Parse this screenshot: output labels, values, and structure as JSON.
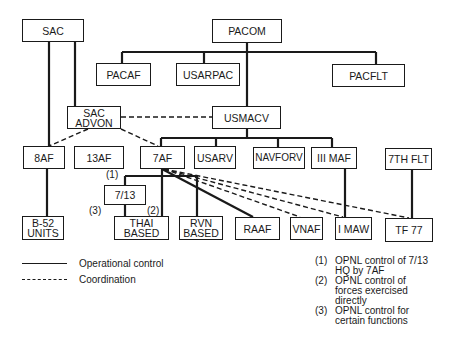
{
  "diagram": {
    "type": "organization-chart",
    "nodes": [
      {
        "id": "sac",
        "label": "SAC",
        "x": 22,
        "y": 19,
        "w": 62,
        "h": 23
      },
      {
        "id": "pacom",
        "label": "PACOM",
        "x": 212,
        "y": 19,
        "w": 70,
        "h": 24
      },
      {
        "id": "pacaf",
        "label": "PACAF",
        "x": 96,
        "y": 63,
        "w": 55,
        "h": 23
      },
      {
        "id": "usarpac",
        "label": "USARPAC",
        "x": 176,
        "y": 63,
        "w": 64,
        "h": 23
      },
      {
        "id": "pacflt",
        "label": "PACFLT",
        "x": 332,
        "y": 64,
        "w": 73,
        "h": 23
      },
      {
        "id": "sac_advon",
        "label": "SAC\nADVON",
        "x": 67,
        "y": 106,
        "w": 54,
        "h": 23
      },
      {
        "id": "usmacv",
        "label": "USMACV",
        "x": 212,
        "y": 106,
        "w": 69,
        "h": 23
      },
      {
        "id": "8af",
        "label": "8AF",
        "x": 23,
        "y": 146,
        "w": 42,
        "h": 23
      },
      {
        "id": "13af",
        "label": "13AF",
        "x": 74,
        "y": 146,
        "w": 50,
        "h": 23
      },
      {
        "id": "7af",
        "label": "7AF",
        "x": 140,
        "y": 146,
        "w": 45,
        "h": 23
      },
      {
        "id": "usarv",
        "label": "USARV",
        "x": 194,
        "y": 146,
        "w": 42,
        "h": 23
      },
      {
        "id": "navforv",
        "label": "NAVFORV",
        "x": 253,
        "y": 147,
        "w": 52,
        "h": 22
      },
      {
        "id": "iii_maf",
        "label": "III MAF",
        "x": 311,
        "y": 147,
        "w": 46,
        "h": 22
      },
      {
        "id": "7th_flt",
        "label": "7TH FLT",
        "x": 385,
        "y": 148,
        "w": 47,
        "h": 22
      },
      {
        "id": "7_13",
        "label": "7/13",
        "x": 104,
        "y": 185,
        "w": 42,
        "h": 20
      },
      {
        "id": "b52_units",
        "label": "B-52\nUNITS",
        "x": 22,
        "y": 216,
        "w": 42,
        "h": 24
      },
      {
        "id": "thai_based",
        "label": "THAI\nBASED",
        "x": 114,
        "y": 216,
        "w": 55,
        "h": 24
      },
      {
        "id": "rvn_based",
        "label": "RVN\nBASED",
        "x": 179,
        "y": 216,
        "w": 44,
        "h": 24
      },
      {
        "id": "raaf",
        "label": "RAAF",
        "x": 235,
        "y": 217,
        "w": 45,
        "h": 23
      },
      {
        "id": "vnaf",
        "label": "VNAF",
        "x": 290,
        "y": 217,
        "w": 33,
        "h": 23
      },
      {
        "id": "i_maw",
        "label": "I MAW",
        "x": 335,
        "y": 217,
        "w": 37,
        "h": 23
      },
      {
        "id": "tf77",
        "label": "TF 77",
        "x": 385,
        "y": 218,
        "w": 48,
        "h": 24
      }
    ],
    "edges": [
      {
        "from": "sac",
        "to": "8af",
        "type": "operational"
      },
      {
        "from": "sac",
        "to": "sac_advon",
        "type": "operational"
      },
      {
        "from": "pacom",
        "to": "pacaf",
        "type": "operational"
      },
      {
        "from": "pacom",
        "to": "usarpac",
        "type": "operational"
      },
      {
        "from": "pacom",
        "to": "pacflt",
        "type": "operational"
      },
      {
        "from": "pacom",
        "to": "usmacv",
        "type": "operational"
      },
      {
        "from": "usmacv",
        "to": "7af",
        "type": "operational"
      },
      {
        "from": "usmacv",
        "to": "usarv",
        "type": "operational"
      },
      {
        "from": "usmacv",
        "to": "navforv",
        "type": "operational"
      },
      {
        "from": "usmacv",
        "to": "iii_maf",
        "type": "operational"
      },
      {
        "from": "8af",
        "to": "b52_units",
        "type": "operational"
      },
      {
        "from": "7af",
        "to": "7_13",
        "type": "operational",
        "note": "(1)"
      },
      {
        "from": "7af",
        "to": "thai_based",
        "type": "operational",
        "note": "(2)"
      },
      {
        "from": "7_13",
        "to": "thai_based",
        "type": "operational",
        "note": "(3)"
      },
      {
        "from": "7af",
        "to": "rvn_based",
        "type": "operational"
      },
      {
        "from": "7af",
        "to": "raaf",
        "type": "operational"
      },
      {
        "from": "iii_maf",
        "to": "i_maw",
        "type": "operational"
      },
      {
        "from": "7th_flt",
        "to": "tf77",
        "type": "operational"
      },
      {
        "from": "sac_advon",
        "to": "usmacv",
        "type": "coordination"
      },
      {
        "from": "sac_advon",
        "to": "8af",
        "type": "coordination"
      },
      {
        "from": "sac_advon",
        "to": "7af",
        "type": "coordination"
      },
      {
        "from": "7af",
        "to": "vnaf",
        "type": "coordination"
      },
      {
        "from": "7af",
        "to": "i_maw",
        "type": "coordination"
      },
      {
        "from": "7af",
        "to": "tf77",
        "type": "coordination"
      }
    ],
    "edge_notes": [
      {
        "label": "(1)",
        "x": 106,
        "y": 172
      },
      {
        "label": "(2)",
        "x": 147,
        "y": 207
      },
      {
        "label": "(3)",
        "x": 89,
        "y": 207
      }
    ]
  },
  "legend": {
    "items": [
      {
        "style": "solid",
        "label": "Operational control"
      },
      {
        "style": "dashed",
        "label": "Coordination"
      }
    ]
  },
  "footnotes": [
    {
      "num": "(1)",
      "text": "OPNL control of 7/13\nHQ by 7AF"
    },
    {
      "num": "(2)",
      "text": "OPNL control of\nforces exercised\ndirectly"
    },
    {
      "num": "(3)",
      "text": "OPNL control for\ncertain functions"
    }
  ],
  "colors": {
    "line": "#1a1a1a",
    "background": "#ffffff"
  }
}
